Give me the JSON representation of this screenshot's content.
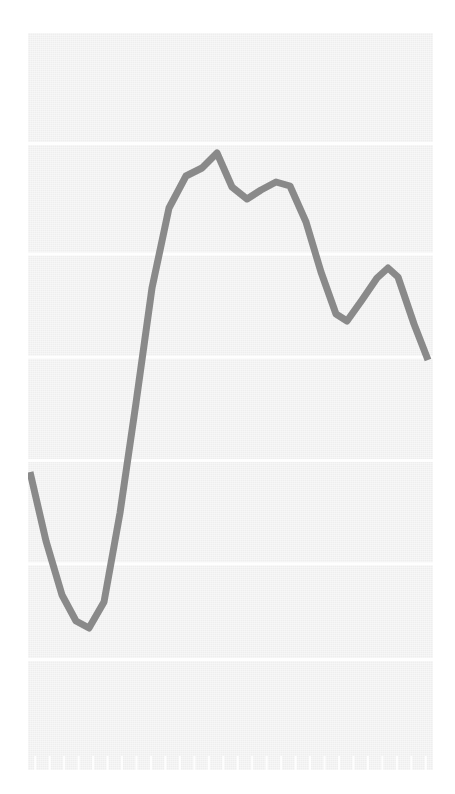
{
  "figure": {
    "title": "",
    "subtitle": "",
    "background_color": "#ffffff",
    "plot_background_color": "#f2f2f2",
    "gridline_color": "#ffffff",
    "line_color": "#808080",
    "line_width_px": 7,
    "plot_area": {
      "x": 28,
      "y": 33,
      "width": 405,
      "height": 737
    }
  },
  "chart_data": {
    "type": "line",
    "title": "",
    "subtitle": "",
    "xlabel": "",
    "ylabel": "",
    "legend": [],
    "legend_position": "none",
    "grid": true,
    "grid_axis": "y",
    "axis_tick_labels_visible": false,
    "xlim": [
      0,
      27
    ],
    "ylim": [
      0,
      100
    ],
    "x_tick_count": 28,
    "y_gridline_values": [
      85,
      70,
      56,
      42,
      28,
      15
    ],
    "x": [
      0,
      1,
      2,
      3,
      4,
      5,
      6,
      7,
      8,
      9,
      10,
      11,
      12,
      13,
      14,
      15,
      16,
      17,
      18,
      19,
      20,
      21,
      22,
      23,
      24,
      25,
      26,
      27
    ],
    "series": [
      {
        "name": "series-1",
        "color": "#808080",
        "values": [
          40,
          30,
          22,
          19,
          19,
          23,
          36,
          55,
          72,
          83,
          88,
          84,
          82,
          85,
          86,
          86,
          83,
          76,
          66,
          58,
          56,
          57,
          62,
          67,
          65,
          61,
          52,
          55
        ]
      }
    ],
    "points_pixel": [
      [
        30,
        472
      ],
      [
        46,
        541
      ],
      [
        62,
        595
      ],
      [
        76,
        621
      ],
      [
        89,
        628
      ],
      [
        104,
        602
      ],
      [
        120,
        513
      ],
      [
        136,
        403
      ],
      [
        152,
        288
      ],
      [
        169,
        208
      ],
      [
        186,
        176
      ],
      [
        202,
        168
      ],
      [
        217,
        153
      ],
      [
        232,
        187
      ],
      [
        247,
        199
      ],
      [
        261,
        190
      ],
      [
        276,
        182
      ],
      [
        290,
        186
      ],
      [
        306,
        222
      ],
      [
        321,
        272
      ],
      [
        336,
        314
      ],
      [
        347,
        321
      ],
      [
        362,
        300
      ],
      [
        377,
        278
      ],
      [
        388,
        268
      ],
      [
        398,
        277
      ],
      [
        414,
        324
      ],
      [
        428,
        360
      ]
    ],
    "annotations": []
  },
  "accessibility": {
    "description": "Line chart with a single gray series on a light gray background with white horizontal gridlines and faint x-axis tick marks. The line begins at a mid-low level, dips to its minimum near the left, rises steeply to a maximum near the left-center, stays elevated with a small notch, then declines to a local minimum on the right before a small rebound and a final drop."
  }
}
